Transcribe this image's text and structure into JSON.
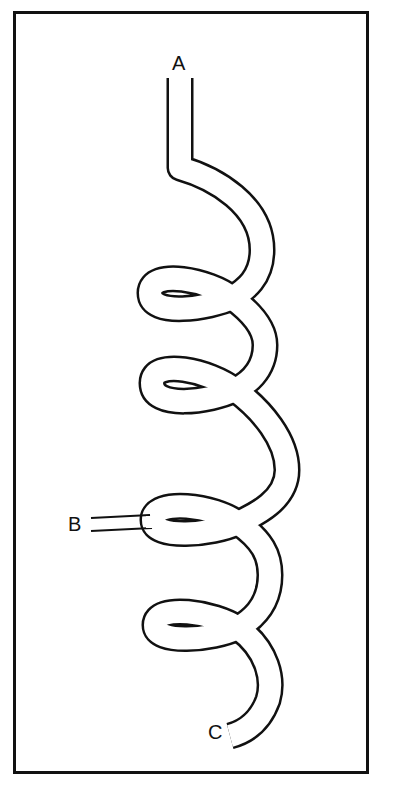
{
  "diagram": {
    "type": "coiled tube / helical coil",
    "labels": {
      "a": "A",
      "b": "B",
      "c": "C"
    },
    "coil_turns": 4,
    "stroke_color": "#111111",
    "background_color": "#ffffff"
  }
}
